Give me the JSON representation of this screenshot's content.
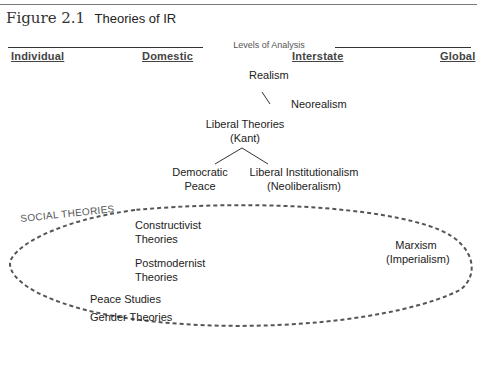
{
  "figure": {
    "number": "Figure 2.1",
    "title": "Theories of IR"
  },
  "axis": {
    "label": "Levels of Analysis",
    "levels": [
      "Individual",
      "Domestic",
      "Interstate",
      "Global"
    ]
  },
  "nodes": {
    "realism": "Realism",
    "neorealism": "Neorealism",
    "liberal_theories": [
      "Liberal Theories",
      "(Kant)"
    ],
    "democratic_peace": [
      "Democratic",
      "Peace"
    ],
    "liberal_institutionalism": [
      "Liberal Institutionalism",
      "(Neoliberalism)"
    ]
  },
  "social_theories": {
    "label": "SOCIAL THEORIES",
    "items": {
      "constructivist": [
        "Constructivist",
        "Theories"
      ],
      "postmodernist": [
        "Postmodernist",
        "Theories"
      ],
      "peace_studies": "Peace Studies",
      "gender": "Gender Theories",
      "marxism": [
        "Marxism",
        "(Imperialism)"
      ]
    }
  },
  "colors": {
    "text": "#222222",
    "rule": "#777777",
    "dashed_ellipse": "#555555"
  }
}
